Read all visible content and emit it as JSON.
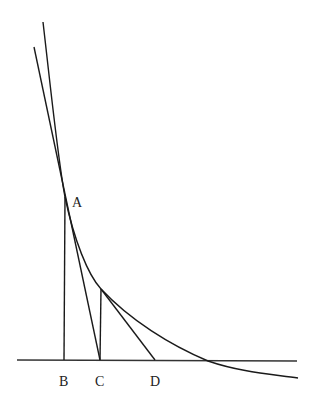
{
  "diagram": {
    "type": "geometry-curve-tangents",
    "points": {
      "A": {
        "label": "A",
        "x": 65,
        "y": 197
      },
      "P": {
        "label": "",
        "x": 101,
        "y": 289
      },
      "B": {
        "label": "B",
        "x": 64,
        "y": 360
      },
      "C": {
        "label": "C",
        "x": 100,
        "y": 360
      },
      "D": {
        "label": "D",
        "x": 155,
        "y": 360
      }
    },
    "labels": {
      "A": "A",
      "B": "B",
      "C": "C",
      "D": "D"
    },
    "axis": {
      "x1": 17,
      "y1": 360,
      "x2": 297,
      "y2": 361
    },
    "colors": {
      "line": "#1a1a1a",
      "axis": "#333333",
      "background": "#ffffff"
    }
  }
}
